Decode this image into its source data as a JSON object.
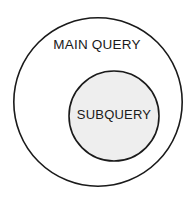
{
  "diagram": {
    "type": "venn-nested",
    "background_color": "#ffffff",
    "outer": {
      "label": "MAIN QUERY",
      "shape": "circle",
      "center_x": 98,
      "center_y": 102,
      "radius": 85,
      "fill_color": "#ffffff",
      "stroke_color": "#1a1a1a",
      "stroke_width": 1.6,
      "label_x": 97,
      "label_y": 46
    },
    "inner": {
      "label": "SUBQUERY",
      "shape": "circle",
      "center_x": 114,
      "center_y": 116,
      "radius": 45,
      "fill_color": "#eeeeee",
      "stroke_color": "#1a1a1a",
      "stroke_width": 1.6,
      "label_x": 114,
      "label_y": 116
    }
  }
}
